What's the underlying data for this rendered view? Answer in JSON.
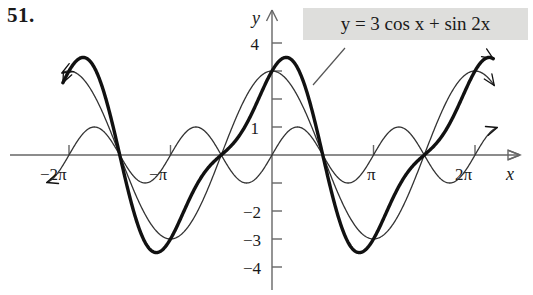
{
  "problem": {
    "number": "51."
  },
  "equation": {
    "text": "y = 3 cos x + sin 2x",
    "box_color": "#dededc"
  },
  "axes": {
    "x_axis_label": "x",
    "y_axis_label": "y",
    "x_tick_labels": [
      "−2π",
      "−π",
      "π",
      "2π"
    ],
    "y_tick_labels": [
      "4",
      "1",
      "−2",
      "−3",
      "−4"
    ]
  },
  "chart_data": {
    "type": "line",
    "title": "",
    "xlabel": "x",
    "ylabel": "y",
    "xlim": [
      -7.2,
      7.6
    ],
    "ylim": [
      -4.4,
      4.4
    ],
    "grid": false,
    "legend": "annotation-box",
    "annotations": [
      {
        "text": "y = 3 cos x + sin 2x",
        "target_series": "sum",
        "leader_from": [
          345,
          48
        ],
        "leader_to": [
          313,
          85
        ]
      }
    ],
    "x_ticks": [
      -6.283185,
      -3.141593,
      3.141593,
      6.283185
    ],
    "x_tick_labels": [
      "−2π",
      "−π",
      "π",
      "2π"
    ],
    "y_ticks": [
      4,
      3,
      2,
      1,
      -1,
      -2,
      -3,
      -4
    ],
    "y_tick_labels_shown": [
      "4",
      "1",
      "−2",
      "−3",
      "−4"
    ],
    "series": [
      {
        "name": "3 cos x",
        "expression": "y = 3 cos x",
        "amplitude": 3,
        "period": 6.283185,
        "style": "thin",
        "color": "#333333",
        "stroke_width": 1.3
      },
      {
        "name": "sin 2x",
        "expression": "y = sin 2x",
        "amplitude": 1,
        "period": 3.141593,
        "style": "thin",
        "color": "#333333",
        "stroke_width": 1.3
      },
      {
        "name": "sum",
        "expression": "y = 3 cos x + sin 2x",
        "style": "thick",
        "color": "#111111",
        "stroke_width": 3.4,
        "max_value": 3.63,
        "min_value": -3.63
      }
    ]
  }
}
